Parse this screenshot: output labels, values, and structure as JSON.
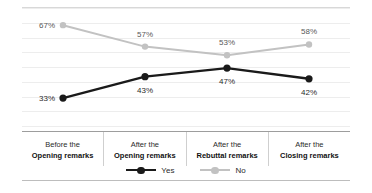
{
  "chart_data": {
    "type": "line",
    "title": "",
    "subtitle": "",
    "xlabel": "",
    "ylabel": "",
    "ylim": [
      20,
      75
    ],
    "grid": true,
    "legend_position": "bottom-center",
    "categories": [
      "Before the Opening remarks",
      "After the Opening remarks",
      "After the Rebuttal remarks",
      "After the Closing remarks"
    ],
    "category_lines": [
      {
        "line1": "Before the",
        "line2": "Opening remarks"
      },
      {
        "line1": "After the",
        "line2": "Opening remarks"
      },
      {
        "line1": "After the",
        "line2": "Rebuttal remarks"
      },
      {
        "line1": "After the",
        "line2": "Closing remarks"
      }
    ],
    "series": [
      {
        "name": "Yes",
        "color": "#1a1a1a",
        "values": [
          33,
          43,
          47,
          42
        ],
        "labels": [
          "33%",
          "43%",
          "47%",
          "42%"
        ],
        "label_positions": [
          "left",
          "below",
          "below",
          "below"
        ]
      },
      {
        "name": "No",
        "color": "#c2c2c2",
        "values": [
          67,
          57,
          53,
          58
        ],
        "labels": [
          "67%",
          "57%",
          "53%",
          "58%"
        ],
        "label_positions": [
          "left",
          "above",
          "above",
          "above"
        ]
      }
    ]
  },
  "legend": {
    "items": [
      {
        "label": "Yes",
        "color": "#1a1a1a"
      },
      {
        "label": "No",
        "color": "#c2c2c2"
      }
    ]
  },
  "colors": {
    "yes": "#1a1a1a",
    "no": "#c2c2c2",
    "gridline": "#ededed",
    "rule": "#c9c9c9",
    "table_border": "#9d9d9d",
    "cell_divider": "#cfcfcf"
  }
}
